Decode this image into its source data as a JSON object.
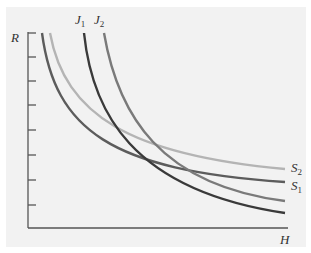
{
  "chart_data": {
    "type": "line",
    "title": "",
    "xlabel": "H",
    "ylabel": "R",
    "grid": false,
    "y_ticks_count": 8,
    "series": [
      {
        "name": "J1",
        "label_main": "J",
        "label_sub": "1",
        "color": "#3a3a3a",
        "shape": "convex decreasing, steep",
        "path": "M84 33 C 92 110, 130 190, 285 213"
      },
      {
        "name": "J2",
        "label_main": "J",
        "label_sub": "2",
        "color": "#7a7a7a",
        "shape": "convex decreasing, steep",
        "path": "M104 33 C 118 115, 160 185, 285 201"
      },
      {
        "name": "S1",
        "label_main": "S",
        "label_sub": "1",
        "color": "#5c5c5c",
        "shape": "convex decreasing, flatter",
        "path": "M42 33 C 55 130, 110 170, 285 182"
      },
      {
        "name": "S2",
        "label_main": "S",
        "label_sub": "2",
        "color": "#b4b4b4",
        "shape": "convex decreasing, flatter",
        "path": "M50 33 C 65 115, 130 155, 285 169"
      }
    ]
  },
  "labels": {
    "y_axis": "R",
    "x_axis": "H",
    "J1": {
      "main": "J",
      "sub": "1"
    },
    "J2": {
      "main": "J",
      "sub": "2"
    },
    "S1": {
      "main": "S",
      "sub": "1"
    },
    "S2": {
      "main": "S",
      "sub": "2"
    }
  }
}
